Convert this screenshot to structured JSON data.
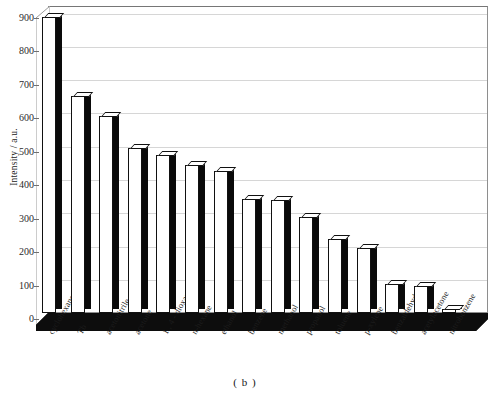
{
  "chart_data": {
    "type": "bar",
    "title": "",
    "subtitle": "",
    "caption": "( b )",
    "xlabel": "",
    "ylabel": "Intensity / a.u.",
    "ylim": [
      0,
      900
    ],
    "ytick_values": [
      0,
      100,
      200,
      300,
      400,
      500,
      600,
      700,
      800,
      900
    ],
    "ytick_labels": [
      "0",
      "100",
      "200",
      "300",
      "400",
      "500",
      "600",
      "700",
      "800",
      "900"
    ],
    "grid": true,
    "legend": "none",
    "style": "3d-column",
    "categories": [
      "cyclohexane",
      "Tb",
      "acetonitrile",
      "acetone",
      "1 , 4 - dioxane",
      "n-hexane",
      "ethanol",
      "benzene",
      "methanol",
      "propanol",
      "toluene",
      "p-xylene",
      "benzaldehyde",
      "acetylacetone",
      "nitrobenzene"
    ],
    "values": [
      885,
      650,
      590,
      493,
      472,
      443,
      425,
      340,
      337,
      288,
      222,
      195,
      88,
      80,
      12
    ]
  },
  "colors": {
    "bar_face": "#ffffff",
    "bar_edge": "#111111",
    "bar_side": "#0a0a0a",
    "gridline": "#d6d6d6",
    "axis": "#8e8e8e",
    "text": "#1a1a1a",
    "background": "#ffffff"
  }
}
